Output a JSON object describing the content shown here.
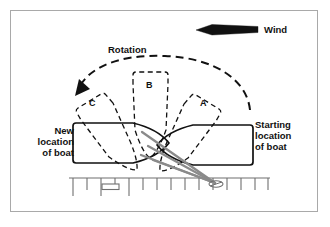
{
  "figure": {
    "background_color": "#ffffff",
    "border_color": "#a9a9a9",
    "line_color": "#111111",
    "rope_color": "#7a7a7a"
  },
  "labels": {
    "wind": "Wind",
    "rotation": "Rotation",
    "new_location": "New\nlocation\nof boat",
    "starting_location": "Starting\nlocation\nof boat",
    "position_a": "A",
    "position_b": "B",
    "position_c": "C"
  },
  "elements": {
    "wind_arrow": {
      "name": "wind-arrow",
      "direction": "left",
      "style": "solid-tapered"
    },
    "rotation_arc": {
      "name": "rotation-arc",
      "direction": "counterclockwise",
      "style": "dashed",
      "arrowhead": "left-end"
    },
    "boat_start": {
      "name": "boat-starting-position",
      "style": "solid",
      "bow": "left",
      "stern": "right"
    },
    "boat_new": {
      "name": "boat-new-position",
      "style": "solid",
      "bow": "right",
      "stern": "left"
    },
    "boat_a": {
      "name": "boat-position-a",
      "style": "dashed"
    },
    "boat_b": {
      "name": "boat-position-b",
      "style": "dashed"
    },
    "boat_c": {
      "name": "boat-position-c",
      "style": "dashed"
    },
    "dock": {
      "name": "dock",
      "style": "solid-with-pilings",
      "piling_count": 14,
      "cleat": "small-rectangle"
    },
    "mooring_lines": {
      "name": "mooring-lines",
      "count": 4,
      "pivot": "dock-cleat"
    }
  }
}
